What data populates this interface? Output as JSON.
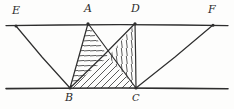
{
  "figure": {
    "stroke_color": "#2e2e2e",
    "hatch_color": "#3a3a3a",
    "background_color": "#fdfdfc"
  },
  "labels": {
    "E": "E",
    "A": "A",
    "D": "D",
    "F": "F",
    "B": "B",
    "C": "C"
  },
  "points": {
    "E": {
      "x": 16,
      "y": 26
    },
    "A": {
      "x": 88,
      "y": 23
    },
    "D": {
      "x": 135,
      "y": 23
    },
    "F": {
      "x": 213,
      "y": 25
    },
    "B": {
      "x": 70,
      "y": 88
    },
    "C": {
      "x": 136,
      "y": 88
    },
    "X": {
      "x": 108,
      "y": 57
    }
  },
  "label_positions": {
    "E": {
      "x": 12,
      "y": 6
    },
    "A": {
      "x": 84,
      "y": 4
    },
    "D": {
      "x": 131,
      "y": 4
    },
    "F": {
      "x": 208,
      "y": 5
    },
    "B": {
      "x": 65,
      "y": 92
    },
    "C": {
      "x": 132,
      "y": 92
    }
  },
  "lines": {
    "top_parallel": {
      "from": "left_edge",
      "to": "right_edge",
      "y": 25
    },
    "bottom_parallel": {
      "from": "left_edge",
      "to": "right_edge",
      "y": 88
    },
    "segments": [
      {
        "name": "EB",
        "from": "E",
        "to": "B"
      },
      {
        "name": "AB",
        "from": "A",
        "to": "B"
      },
      {
        "name": "AC",
        "from": "A",
        "to": "C"
      },
      {
        "name": "DB",
        "from": "D",
        "to": "B"
      },
      {
        "name": "DC",
        "from": "D",
        "to": "C"
      },
      {
        "name": "FC",
        "from": "F",
        "to": "C"
      }
    ]
  },
  "hatched_regions": [
    {
      "name": "triangle-ABX",
      "pattern": "horizontal",
      "vertices": "A,B,X"
    },
    {
      "name": "triangle-DXC",
      "pattern": "vertical",
      "vertices": "D,X,C"
    },
    {
      "name": "quad-BXC-base",
      "pattern": "diagonal",
      "vertices": "B,X,C"
    }
  ]
}
